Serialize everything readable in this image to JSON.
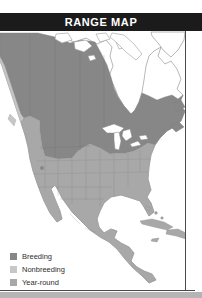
{
  "header": {
    "title": "RANGE MAP",
    "bg_color": "#1b1b1b",
    "text_color": "#ffffff"
  },
  "legend": {
    "items": [
      {
        "label": "Breeding",
        "color": "#878787"
      },
      {
        "label": "Nonbreeding",
        "color": "#c7c7c7"
      },
      {
        "label": "Year-round",
        "color": "#a8a8a8"
      }
    ]
  },
  "map": {
    "depicts": "North America range map",
    "water_color": "#ffffff",
    "outline_color": "#9a9a9a",
    "frame_color": "#4a4a4a",
    "footer_strip_color": "#b5b5b5"
  }
}
